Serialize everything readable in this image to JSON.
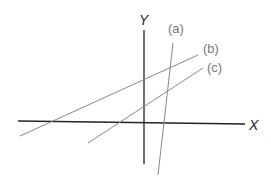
{
  "diagram": {
    "axes": {
      "x_label": "X",
      "y_label": "Y"
    },
    "lines": [
      {
        "id": "a",
        "label": "(a)"
      },
      {
        "id": "b",
        "label": "(b)"
      },
      {
        "id": "c",
        "label": "(c)"
      }
    ],
    "colors": {
      "axis": "#222222",
      "line": "#888888",
      "label": "#777777"
    }
  }
}
